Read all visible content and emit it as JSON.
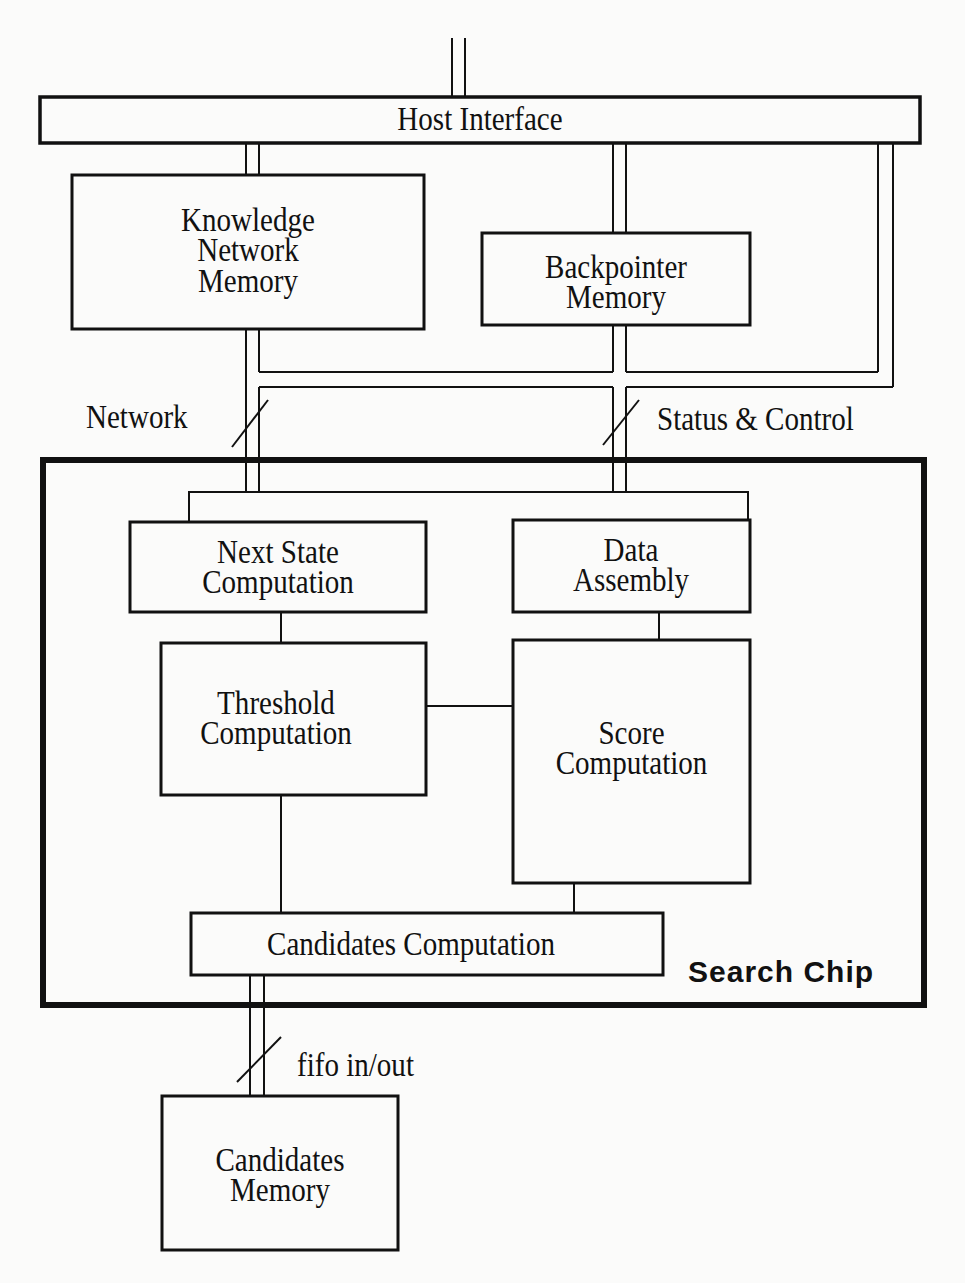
{
  "diagram": {
    "type": "block-diagram",
    "blocks": {
      "host_interface": "Host Interface",
      "knowledge_network_memory": [
        "Knowledge",
        "Network",
        "Memory"
      ],
      "backpointer_memory": [
        "Backpointer",
        "Memory"
      ],
      "next_state_computation": [
        "Next State",
        "Computation"
      ],
      "data_assembly": [
        "Data",
        "Assembly"
      ],
      "threshold_computation": [
        "Threshold",
        "Computation"
      ],
      "score_computation": [
        "Score",
        "Computation"
      ],
      "candidates_computation": "Candidates Computation",
      "candidates_memory": [
        "Candidates",
        "Memory"
      ]
    },
    "container": {
      "search_chip": "Search Chip"
    },
    "bus_labels": {
      "network": "Network",
      "status_control": "Status & Control",
      "fifo": "fifo in/out"
    },
    "connections": [
      [
        "external",
        "Host Interface"
      ],
      [
        "Host Interface",
        "Knowledge Network Memory"
      ],
      [
        "Host Interface",
        "Backpointer Memory"
      ],
      [
        "Host Interface",
        "Status & Control bus"
      ],
      [
        "Knowledge Network Memory",
        "Search Chip (Network bus)"
      ],
      [
        "Backpointer Memory",
        "Search Chip (Status & Control bus)"
      ],
      [
        "Next State Computation",
        "Threshold Computation"
      ],
      [
        "Data Assembly",
        "Score Computation"
      ],
      [
        "Threshold Computation",
        "Score Computation"
      ],
      [
        "Threshold Computation",
        "Candidates Computation"
      ],
      [
        "Score Computation",
        "Candidates Computation"
      ],
      [
        "Candidates Computation",
        "Candidates Memory (fifo in/out)"
      ]
    ],
    "colors": {
      "ink": "#111111",
      "paper": "#fbfbfa"
    }
  }
}
